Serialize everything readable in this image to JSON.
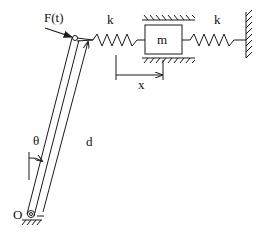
{
  "diagram": {
    "type": "mechanical-system",
    "labels": {
      "force": "F(t)",
      "spring_left": "k",
      "spring_right": "k",
      "mass": "m",
      "displacement": "x",
      "angle": "θ",
      "length": "d",
      "pivot": "O"
    },
    "colors": {
      "stroke": "#1a1a1a",
      "background": "#ffffff"
    }
  }
}
